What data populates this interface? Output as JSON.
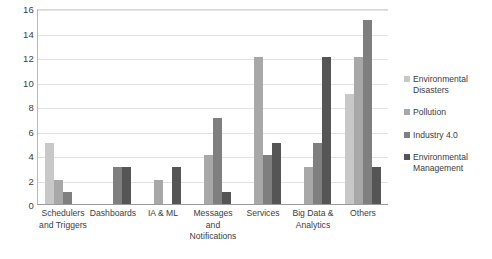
{
  "chart_data": {
    "type": "bar",
    "title": "",
    "xlabel": "",
    "ylabel": "",
    "ylim": [
      0,
      16
    ],
    "ytick_step": 2,
    "yticks": [
      "0",
      "2",
      "4",
      "6",
      "8",
      "10",
      "12",
      "14",
      "16"
    ],
    "grid": true,
    "legend_position": "right",
    "categories": [
      "Schedulers and Triggers",
      "Dashboards",
      "IA & ML",
      "Messages and Notifications",
      "Services",
      "Big Data & Analytics",
      "Others"
    ],
    "series": [
      {
        "name": "Environmental Disasters",
        "color": "#c8c8c8",
        "values": [
          5,
          0,
          0,
          0,
          0,
          0,
          9
        ]
      },
      {
        "name": "Pollution",
        "color": "#a8a8a8",
        "values": [
          2,
          0,
          2,
          4,
          12,
          3,
          12
        ]
      },
      {
        "name": "Industry 4.0",
        "color": "#7f7f7f",
        "values": [
          1,
          3,
          0,
          7,
          4,
          5,
          15
        ]
      },
      {
        "name": "Environmental Management",
        "color": "#555555",
        "values": [
          0,
          3,
          3,
          1,
          5,
          12,
          3
        ]
      }
    ]
  }
}
